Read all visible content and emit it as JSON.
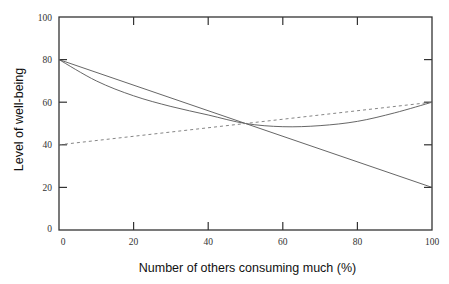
{
  "chart_data": {
    "type": "line",
    "title": "",
    "xlabel": "Number of others consuming much (%)",
    "ylabel": "Level of well-being",
    "xlim": [
      0,
      100
    ],
    "ylim": [
      0,
      100
    ],
    "x_ticks": [
      0,
      20,
      40,
      60,
      80,
      100
    ],
    "y_ticks": [
      0,
      20,
      40,
      60,
      80,
      100
    ],
    "grid": false,
    "legend": null,
    "series": [
      {
        "name": "solid-linear-decreasing",
        "style": "solid",
        "x": [
          0,
          50,
          100
        ],
        "y": [
          80,
          50,
          20
        ]
      },
      {
        "name": "solid-curved",
        "style": "solid",
        "x": [
          0,
          10,
          20,
          30,
          40,
          50,
          60,
          70,
          80,
          90,
          100
        ],
        "y": [
          80,
          70,
          63,
          58,
          54,
          50,
          48.5,
          49,
          51,
          55,
          60
        ]
      },
      {
        "name": "dashed-linear-increasing",
        "style": "dashed",
        "x": [
          0,
          50,
          100
        ],
        "y": [
          40,
          50,
          60
        ]
      }
    ]
  },
  "axes": {
    "x_title": "Number of others consuming much (%)",
    "y_title": "Level of well-being",
    "x_tick_labels": [
      "0",
      "20",
      "40",
      "60",
      "80",
      "100"
    ],
    "y_tick_labels": [
      "0",
      "20",
      "40",
      "60",
      "80",
      "100"
    ]
  }
}
